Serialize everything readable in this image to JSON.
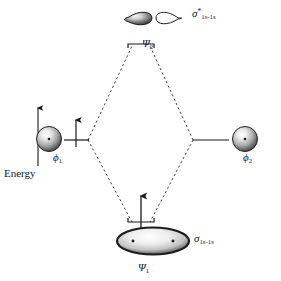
{
  "diagram": {
    "axis": {
      "label": "Energy",
      "direction": "up",
      "icon": "up-arrow-icon"
    },
    "atomic_orbitals": [
      {
        "id": "phi1",
        "label": "ϕ",
        "subscript": "1",
        "side": "left",
        "electrons": 1,
        "electron_spin": "up",
        "orbital_shape": "sphere",
        "orbital_fill": "shaded",
        "nucleus_dot": true
      },
      {
        "id": "phi2",
        "label": "ϕ",
        "subscript": "2",
        "side": "right",
        "electrons": 0,
        "electron_spin": "",
        "orbital_shape": "sphere",
        "orbital_fill": "shaded",
        "nucleus_dot": true
      }
    ],
    "molecular_orbitals": [
      {
        "id": "psi2",
        "label": "Ψ",
        "subscript": "2",
        "type": "antibonding",
        "sigma_label": "σ",
        "sigma_star": "*",
        "sigma_subscript": "1s-1s",
        "electrons": 0,
        "electron_spin": "",
        "level": "top",
        "orbital_shape": "two-lobes",
        "lobe_left_fill": "shaded",
        "lobe_right_fill": "white",
        "node": true
      },
      {
        "id": "psi1",
        "label": "Ψ",
        "subscript": "1",
        "type": "bonding",
        "sigma_label": "σ",
        "sigma_star": "",
        "sigma_subscript": "1s-1s",
        "electrons": 1,
        "electron_spin": "up",
        "level": "bottom",
        "orbital_shape": "ellipse",
        "orbital_fill": "shaded",
        "nucleus_dots": 2
      }
    ],
    "correlation_lines": {
      "style": "dashed",
      "shape": "rhombus",
      "color": "#2a2a2a"
    },
    "colors": {
      "stroke": "#1a1a1a",
      "dashed": "#2a2a2a",
      "orbital_dark": "#3a3a3a",
      "orbital_light": "#f2f2f2",
      "background": "#ffffff"
    }
  }
}
